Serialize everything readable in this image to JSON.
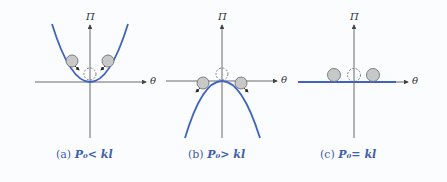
{
  "figure": {
    "panels": [
      {
        "id": "a",
        "y_axis_label": "Π",
        "x_axis_label": "θ",
        "curve": "upward parabola (stable)",
        "caption_prefix": "(a)",
        "caption_math": "P₀< kl"
      },
      {
        "id": "b",
        "y_axis_label": "Π",
        "x_axis_label": "θ",
        "curve": "downward parabola (unstable)",
        "caption_prefix": "(b)",
        "caption_math": "P₀> kl"
      },
      {
        "id": "c",
        "y_axis_label": "Π",
        "x_axis_label": "θ",
        "curve": "flat line (neutral)",
        "caption_prefix": "(c)",
        "caption_math": "P₀= kl"
      }
    ],
    "left_edge_label": "θ",
    "colors": {
      "curve": "#3f64c0",
      "caption": "#3d5fb0",
      "axis": "#444444",
      "ball_fill": "#c8c8c8",
      "ball_stroke": "#666666"
    }
  }
}
